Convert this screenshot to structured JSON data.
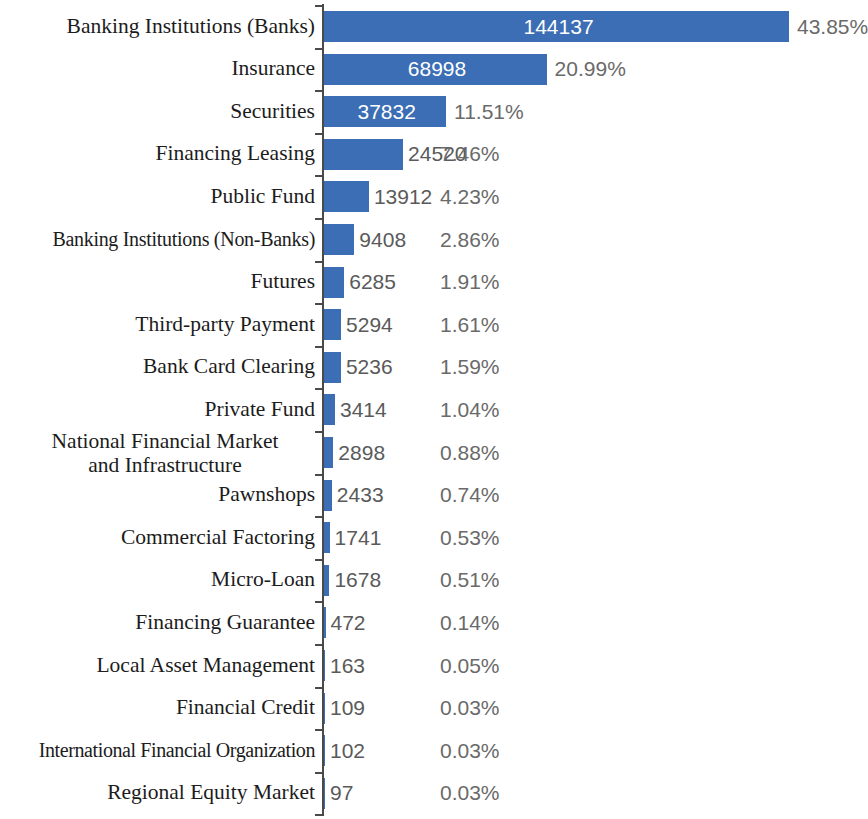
{
  "chart_data": {
    "type": "bar",
    "orientation": "horizontal",
    "title": "",
    "subtitle": "",
    "xlabel": "",
    "ylabel": "",
    "grid": false,
    "legend": "none",
    "axis": {
      "category_axis": "vertical-left",
      "value_axis_visible": false,
      "xlim": [
        0,
        144137
      ]
    },
    "total": 328669,
    "categories": [
      "Banking Institutions (Banks)",
      "Insurance",
      "Securities",
      "Financing Leasing",
      "Public Fund",
      "Banking Institutions (Non-Banks)",
      "Futures",
      "Third-party Payment",
      "Bank Card Clearing",
      "Private Fund",
      "National Financial Market\nand Infrastructure",
      "Pawnshops",
      "Commercial Factoring",
      "Micro-Loan",
      "Financing Guarantee",
      "Local Asset Management",
      "Financial Credit",
      "International Financial Organization",
      "Regional Equity Market"
    ],
    "values": [
      144137,
      68998,
      37832,
      24520,
      13912,
      9408,
      6285,
      5294,
      5236,
      3414,
      2898,
      2433,
      1741,
      1678,
      472,
      163,
      109,
      102,
      97
    ],
    "value_labels": [
      "144137",
      "68998",
      "37832",
      "24520",
      "13912",
      "9408",
      "6285",
      "5294",
      "5236",
      "3414",
      "2898",
      "2433",
      "1741",
      "1678",
      "472",
      "163",
      "109",
      "102",
      "97"
    ],
    "percentages": [
      "43.85%",
      "20.99%",
      "11.51%",
      "7.46%",
      "4.23%",
      "2.86%",
      "1.91%",
      "1.61%",
      "1.59%",
      "1.04%",
      "0.88%",
      "0.74%",
      "0.53%",
      "0.51%",
      "0.14%",
      "0.05%",
      "0.03%",
      "0.03%",
      "0.03%"
    ],
    "percent_values": [
      43.85,
      20.99,
      11.51,
      7.46,
      4.23,
      2.86,
      1.91,
      1.61,
      1.59,
      1.04,
      0.88,
      0.74,
      0.53,
      0.51,
      0.14,
      0.05,
      0.03,
      0.03,
      0.03
    ],
    "colors": {
      "bar": "#3b6eb4",
      "axis": "#4a4a4a",
      "category_text": "#1c1c1c",
      "value_text_inside": "#ffffff",
      "value_text_outside": "#5a5a5a",
      "percent_text": "#6a6a6a",
      "background": "#ffffff"
    }
  }
}
